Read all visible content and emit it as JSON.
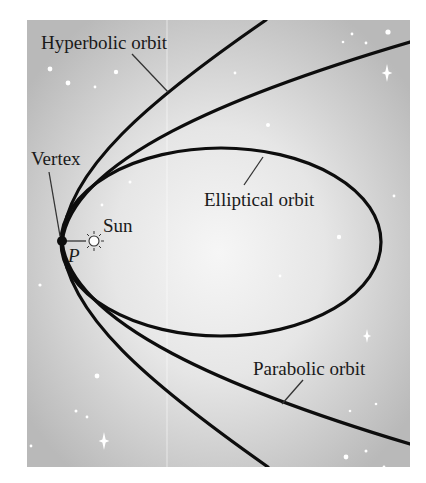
{
  "figure": {
    "frame": {
      "x": 27,
      "y": 20,
      "width": 383,
      "height": 447
    },
    "colors": {
      "background_center": "#f6f6f6",
      "background_edge": "#b9b9b9",
      "curve": "#0d0d0d",
      "leader": "#333333",
      "star": "#ffffff"
    }
  },
  "labels": {
    "hyperbolic": "Hyperbolic orbit",
    "elliptical": "Elliptical orbit",
    "parabolic": "Parabolic orbit",
    "vertex": "Vertex",
    "sun": "Sun",
    "point": "P"
  },
  "icons": {
    "sun": "sun-icon",
    "vertex_point": "vertex-dot-icon"
  },
  "curves": {
    "hyperbola": "M 266 20 C 150 100, 66 170, 62 242 C 66 314, 150 384, 268 467",
    "parabola": "M 410 42 C 230 95, 72 160, 62 242 C 72 324, 230 390, 410 444",
    "ellipse": {
      "cx": 221,
      "cy": 242,
      "rx": 160,
      "ry": 94
    }
  },
  "stars": [
    {
      "x": 50,
      "y": 69,
      "r": 2.4
    },
    {
      "x": 68,
      "y": 83,
      "r": 2.4
    },
    {
      "x": 95,
      "y": 87,
      "r": 1.4
    },
    {
      "x": 116,
      "y": 72,
      "r": 2.2
    },
    {
      "x": 130,
      "y": 182,
      "r": 1.5
    },
    {
      "x": 102,
      "y": 205,
      "r": 1.4
    },
    {
      "x": 40,
      "y": 285,
      "r": 1.6
    },
    {
      "x": 97,
      "y": 376,
      "r": 2.4
    },
    {
      "x": 76,
      "y": 411,
      "r": 1.5
    },
    {
      "x": 87,
      "y": 417,
      "r": 1.4
    },
    {
      "x": 31,
      "y": 446,
      "r": 1.4
    },
    {
      "x": 268,
      "y": 125,
      "r": 2.0
    },
    {
      "x": 235,
      "y": 73,
      "r": 1.4
    },
    {
      "x": 352,
      "y": 34,
      "r": 1.4
    },
    {
      "x": 343,
      "y": 42,
      "r": 1.3
    },
    {
      "x": 366,
      "y": 43,
      "r": 1.4
    },
    {
      "x": 388,
      "y": 32,
      "r": 2.6
    },
    {
      "x": 339,
      "y": 237,
      "r": 2.2
    },
    {
      "x": 394,
      "y": 196,
      "r": 1.4
    },
    {
      "x": 280,
      "y": 276,
      "r": 1.4
    },
    {
      "x": 350,
      "y": 411,
      "r": 1.3
    },
    {
      "x": 376,
      "y": 404,
      "r": 1.3
    },
    {
      "x": 346,
      "y": 457,
      "r": 2.4
    },
    {
      "x": 366,
      "y": 451,
      "r": 1.5
    },
    {
      "x": 384,
      "y": 467,
      "r": 1.4
    }
  ],
  "sparkles": [
    {
      "x": 387,
      "y": 73,
      "s": 9
    },
    {
      "x": 367,
      "y": 336,
      "s": 7
    },
    {
      "x": 104,
      "y": 441,
      "s": 9
    }
  ]
}
